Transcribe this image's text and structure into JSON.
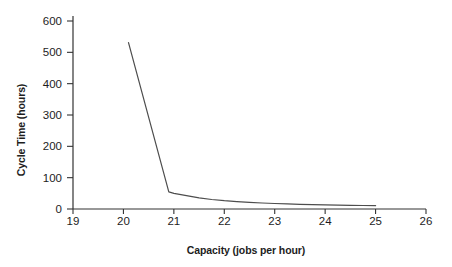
{
  "chart_data": {
    "type": "line",
    "title": "",
    "xlabel": "Capacity (jobs per hour)",
    "ylabel": "Cycle Time (hours)",
    "xlim": [
      19,
      26
    ],
    "ylim": [
      0,
      600
    ],
    "x_ticks": [
      19,
      20,
      21,
      22,
      23,
      24,
      25,
      26
    ],
    "y_ticks": [
      0,
      100,
      200,
      300,
      400,
      500,
      600
    ],
    "grid": false,
    "legend_position": "none",
    "axis_color": "#333333",
    "line_color": "#4d4d4d",
    "text_color": "#1d1d1d",
    "background_color": "#ffffff",
    "series": [
      {
        "name": "cycle-time-vs-capacity",
        "points": [
          [
            20.1,
            531
          ],
          [
            20.9,
            55
          ],
          [
            21.0,
            50
          ],
          [
            21.25,
            42.4
          ],
          [
            21.5,
            35.3
          ],
          [
            21.75,
            30.3
          ],
          [
            22.0,
            26.5
          ],
          [
            22.25,
            23.6
          ],
          [
            22.5,
            21.2
          ],
          [
            22.75,
            19.3
          ],
          [
            23.0,
            17.7
          ],
          [
            23.25,
            16.3
          ],
          [
            23.5,
            15.1
          ],
          [
            23.75,
            14.1
          ],
          [
            24.0,
            13.3
          ],
          [
            24.25,
            12.5
          ],
          [
            24.5,
            11.8
          ],
          [
            24.75,
            11.2
          ],
          [
            25.0,
            10.6
          ]
        ]
      }
    ]
  }
}
